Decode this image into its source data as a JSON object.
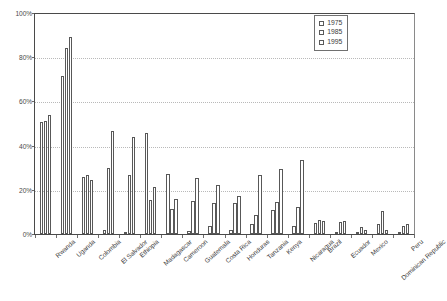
{
  "chart_data": {
    "type": "bar",
    "title": "",
    "subtitle": "",
    "xlabel": "",
    "ylabel": "",
    "ylim": [
      0,
      100
    ],
    "y_ticks": [
      "0%",
      "20%",
      "40%",
      "60%",
      "80%",
      "100%"
    ],
    "y_tick_values": [
      0,
      20,
      40,
      60,
      80,
      100
    ],
    "grid": "horizontal-dotted",
    "legend_position": "top-right",
    "bar_style": "white-fill-dark-outline",
    "categories": [
      "Rwanda",
      "Uganda",
      "Colombia",
      "El Salvador",
      "Ethiopia",
      "Madagascar",
      "Cameroon",
      "Guatemala",
      "Costa Rica",
      "Honduras",
      "Tanzania",
      "Kenya",
      "Nicaragua",
      "Brazil",
      "Ecuador",
      "Mexico",
      "Dominican Republic",
      "Peru"
    ],
    "series": [
      {
        "name": "1975",
        "values": [
          50.5,
          71.5,
          26.0,
          30.0,
          26.5,
          15.5,
          11.5,
          15.0,
          14.0,
          14.0,
          8.5,
          14.5,
          12.0,
          6.5,
          5.5,
          0.8,
          4.5,
          3.8
        ]
      },
      {
        "name": "1985",
        "values": [
          51.0,
          84.0,
          26.5,
          46.5,
          44.0,
          21.5,
          15.5,
          25.5,
          22.0,
          17.0,
          26.5,
          29.5,
          33.5,
          6.0,
          6.0,
          3.0,
          10.5,
          4.5
        ]
      },
      {
        "name": "1995",
        "values": [
          54.0,
          89.0,
          24.5,
          46.5,
          45.5,
          27.0,
          16.0,
          25.5,
          22.0,
          17.0,
          11.0,
          29.5,
          33.5,
          6.0,
          6.0,
          3.0,
          10.5,
          4.5
        ]
      }
    ],
    "bar_values_by_group": [
      {
        "category": "Rwanda",
        "v1975": 50.5,
        "v1985": 51.0,
        "v1995": 54.0
      },
      {
        "category": "Uganda",
        "v1975": 71.5,
        "v1985": 84.0,
        "v1995": 89.0
      },
      {
        "category": "Colombia",
        "v1975": 26.0,
        "v1985": 26.5,
        "v1995": 24.5
      },
      {
        "category": "El Salvador",
        "v1975": 2.0,
        "v1985": 30.0,
        "v1995": 46.5
      },
      {
        "category": "Ethiopia",
        "v1975": 1.0,
        "v1985": 26.5,
        "v1995": 44.0
      },
      {
        "category": "Madagascar",
        "v1975": 45.5,
        "v1985": 15.5,
        "v1995": 21.5
      },
      {
        "category": "Cameroon",
        "v1975": 27.0,
        "v1985": 11.5,
        "v1995": 16.0
      },
      {
        "category": "Guatemala",
        "v1975": 1.5,
        "v1985": 15.0,
        "v1995": 25.5
      },
      {
        "category": "Costa Rica",
        "v1975": 3.5,
        "v1985": 14.0,
        "v1995": 22.0
      },
      {
        "category": "Honduras",
        "v1975": 1.8,
        "v1985": 14.0,
        "v1995": 17.0
      },
      {
        "category": "Tanzania",
        "v1975": 4.5,
        "v1985": 8.5,
        "v1995": 26.5
      },
      {
        "category": "Kenya",
        "v1975": 11.0,
        "v1985": 14.5,
        "v1995": 29.5
      },
      {
        "category": "Nicaragua",
        "v1975": 3.5,
        "v1985": 12.0,
        "v1995": 33.5
      },
      {
        "category": "Brazil",
        "v1975": 5.0,
        "v1985": 6.5,
        "v1995": 6.0
      },
      {
        "category": "Ecuador",
        "v1975": 0.8,
        "v1985": 5.5,
        "v1995": 6.0
      },
      {
        "category": "Mexico",
        "v1975": 1.0,
        "v1985": 3.0,
        "v1995": 2.0
      },
      {
        "category": "Dominican Republic",
        "v1975": 4.5,
        "v1985": 10.5,
        "v1995": 2.0
      },
      {
        "category": "Peru",
        "v1975": 0.8,
        "v1985": 3.8,
        "v1995": 4.5
      }
    ],
    "legend_entries": [
      "1975",
      "1985",
      "1995"
    ]
  },
  "legend": {
    "items": [
      {
        "label": "1975",
        "swatch": "legend-swatch-square"
      },
      {
        "label": "1985",
        "swatch": "legend-swatch-square"
      },
      {
        "label": "1995",
        "swatch": "legend-swatch-square"
      }
    ]
  },
  "colors": {
    "bar_fill": "#ffffff",
    "bar_outline": "#585858",
    "axis": "#4a4a4a",
    "gridline": "#b9b9b9",
    "text": "#3c3c3c",
    "background": "#ffffff"
  }
}
